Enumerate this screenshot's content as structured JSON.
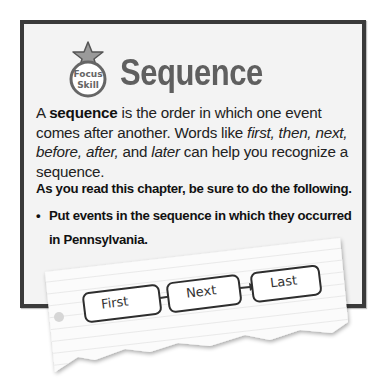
{
  "header": {
    "badge": {
      "line1": "Focus",
      "line2": "Skill",
      "icon": "star-icon"
    },
    "title": "Sequence"
  },
  "definition": {
    "lead": "A ",
    "term": "sequence",
    "text1": " is the order in which one event comes after another. Words like ",
    "examples": [
      "first, then, next,",
      "before, after,",
      "later"
    ],
    "joiner": " and ",
    "text2": " can help you recognize a sequence."
  },
  "instructions": {
    "heading": "As you read this chapter, be sure to do the following.",
    "bullets": [
      {
        "marker": "•",
        "text": "Put events in the sequence in which they occurred in Pennsylvania."
      }
    ]
  },
  "organizer": {
    "steps": [
      "First",
      "Next",
      "Last"
    ],
    "connector": "arrow-right-icon"
  },
  "colors": {
    "frame_border": "#3a3a3a",
    "frame_bg": "#f3f3f3",
    "title": "#5f5f5f",
    "paper": "#fbfbfb",
    "paper_lines": "#e2e2e2"
  }
}
